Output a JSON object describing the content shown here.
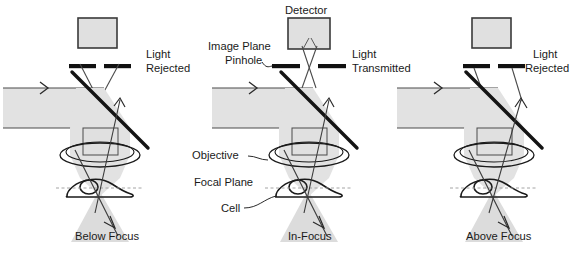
{
  "figure": {
    "type": "confocal-microscopy-optical-path-diagram",
    "panel_count": 3,
    "colors": {
      "beam_fill": "#e2e2e2",
      "beam_fill_light": "#ebebeb",
      "stroke": "#1a1a1a",
      "ray_stroke": "#3a3a3a",
      "detector_fill": "#e0e0e0",
      "background": "#ffffff",
      "focal_plane_line": "#8a8a8a"
    }
  },
  "panels": [
    {
      "id": "below-focus",
      "bottom_label": "Below Focus",
      "outcome_label_line1": "Light",
      "outcome_label_line2": "Rejected",
      "detector_labeled": false,
      "pinhole_blocked": true,
      "detector_label": ""
    },
    {
      "id": "in-focus",
      "bottom_label": "In-Focus",
      "outcome_label_line1": "Light",
      "outcome_label_line2": "Transmitted",
      "detector_labeled": true,
      "pinhole_blocked": false,
      "detector_label": "Detector",
      "image_plane_label_line1": "Image Plane",
      "image_plane_label_line2": "Pinhole",
      "objective_label": "Objective",
      "focal_plane_label": "Focal Plane",
      "cell_label": "Cell"
    },
    {
      "id": "above-focus",
      "bottom_label": "Above Focus",
      "outcome_label_line1": "Light",
      "outcome_label_line2": "Rejected",
      "detector_labeled": false,
      "pinhole_blocked": true,
      "detector_label": ""
    }
  ],
  "labels": {
    "detector": "Detector",
    "image_plane": "Image Plane",
    "pinhole": "Pinhole",
    "light": "Light",
    "transmitted": "Transmitted",
    "rejected": "Rejected",
    "objective": "Objective",
    "focal_plane": "Focal Plane",
    "cell": "Cell",
    "below_focus": "Below Focus",
    "in_focus": "In-Focus",
    "above_focus": "Above Focus"
  }
}
